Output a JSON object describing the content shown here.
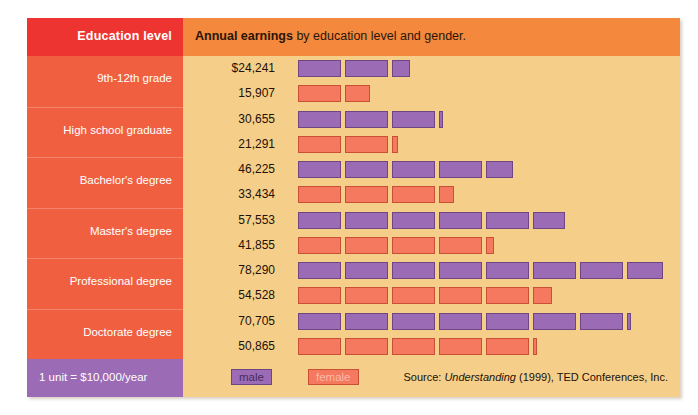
{
  "figure": {
    "header": {
      "left_label": "Education level",
      "title_bold": "Annual earnings",
      "title_rest": " by education level and gender."
    },
    "footer": {
      "unit_note": "1 unit = $10,000/year",
      "legend": [
        {
          "key": "male",
          "label": "male",
          "color": "#9b6bb5"
        },
        {
          "key": "female",
          "label": "female",
          "color": "#f5795e"
        }
      ],
      "source_prefix": "Source: ",
      "source_italic": "Understanding",
      "source_rest": " (1999), TED Conferences, Inc."
    },
    "colors": {
      "header_red": "#ee3431",
      "header_orange": "#f4883c",
      "sidebar_coral": "#f15f41",
      "plot_background": "#f5cf8a",
      "male_purple": "#9b6bb5",
      "female_salmon": "#f5795e",
      "footer_purple": "#9b6bb5"
    }
  },
  "chart_data": {
    "type": "bar",
    "title": "Annual earnings by education level and gender.",
    "subtitle": "1 unit = $10,000/year",
    "xlabel": "",
    "ylabel": "Education level",
    "unit_value": 10000,
    "unit_label": "1 unit = $10,000/year",
    "currency": "USD",
    "grid": false,
    "legend_position": "bottom-left",
    "categories": [
      "9th-12th grade",
      "High school graduate",
      "Bachelor's degree",
      "Master's degree",
      "Professional degree",
      "Doctorate degree"
    ],
    "series": [
      {
        "name": "male",
        "color": "#9b6bb5",
        "values": [
          24241,
          30655,
          46225,
          57553,
          78290,
          70705
        ],
        "labels": [
          "$24,241",
          "30,655",
          "46,225",
          "57,553",
          "78,290",
          "70,705"
        ]
      },
      {
        "name": "female",
        "color": "#f5795e",
        "values": [
          15907,
          21291,
          33434,
          41855,
          54528,
          50865
        ],
        "labels": [
          "15,907",
          "21,291",
          "33,434",
          "41,855",
          "54,528",
          "50,865"
        ]
      }
    ],
    "rows": [
      {
        "category": "9th-12th grade",
        "male_label": "$24,241",
        "male_value": 24241,
        "female_label": "15,907",
        "female_value": 15907
      },
      {
        "category": "High school graduate",
        "male_label": "30,655",
        "male_value": 30655,
        "female_label": "21,291",
        "female_value": 21291
      },
      {
        "category": "Bachelor's degree",
        "male_label": "46,225",
        "male_value": 46225,
        "female_label": "33,434",
        "female_value": 33434
      },
      {
        "category": "Master's degree",
        "male_label": "57,553",
        "male_value": 57553,
        "female_label": "41,855",
        "female_value": 41855
      },
      {
        "category": "Professional degree",
        "male_label": "78,290",
        "male_value": 78290,
        "female_label": "54,528",
        "female_value": 54528
      },
      {
        "category": "Doctorate degree",
        "male_label": "70,705",
        "male_value": 70705,
        "female_label": "50,865",
        "female_value": 50865
      }
    ],
    "source": "Source: Understanding (1999), TED Conferences, Inc."
  }
}
